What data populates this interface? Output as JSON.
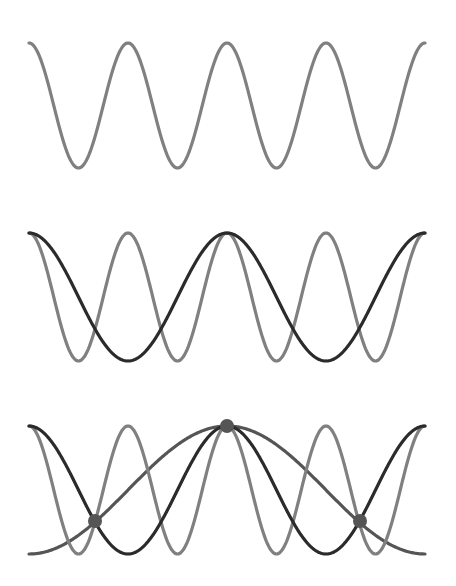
{
  "diagram": {
    "x_start": 29,
    "x_end": 425,
    "panels": [
      {
        "name": "panel-1",
        "top": 43,
        "bottom": 168,
        "waves": [
          {
            "name": "wave-short",
            "periods": 4,
            "color": "#808080",
            "width": 3.2,
            "phase": "peak-at-start"
          }
        ],
        "dots": []
      },
      {
        "name": "panel-2",
        "top": 233,
        "bottom": 361,
        "waves": [
          {
            "name": "wave-short",
            "periods": 4,
            "color": "#808080",
            "width": 3.2,
            "phase": "peak-at-start"
          },
          {
            "name": "wave-medium",
            "periods": 2,
            "color": "#2b2b2b",
            "width": 3.2,
            "phase": "peak-at-start"
          }
        ],
        "dots": []
      },
      {
        "name": "panel-3",
        "top": 426,
        "bottom": 554,
        "waves": [
          {
            "name": "wave-short",
            "periods": 4,
            "color": "#808080",
            "width": 3.2,
            "phase": "peak-at-start"
          },
          {
            "name": "wave-medium",
            "periods": 2,
            "color": "#2b2b2b",
            "width": 3.2,
            "phase": "peak-at-start"
          },
          {
            "name": "wave-long",
            "periods": 1,
            "color": "#555555",
            "width": 3.2,
            "phase": "trough-at-start"
          }
        ],
        "dots": [
          {
            "x": 227,
            "y": 426,
            "r": 7,
            "color": "#555555"
          },
          {
            "x": 95,
            "y": 521,
            "r": 7,
            "color": "#555555"
          },
          {
            "x": 360,
            "y": 521,
            "r": 7,
            "color": "#555555"
          }
        ]
      }
    ]
  }
}
